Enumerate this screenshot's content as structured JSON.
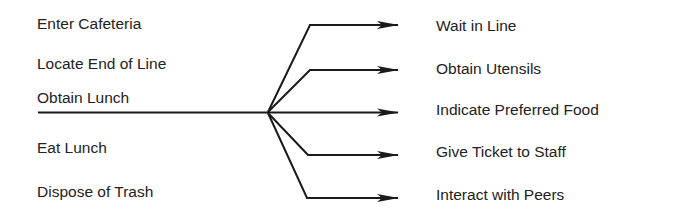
{
  "diagram": {
    "left_steps": [
      {
        "label": "Enter Cafeteria"
      },
      {
        "label": "Locate End of Line"
      },
      {
        "label": "Obtain Lunch",
        "expanded": true
      },
      {
        "label": "Eat Lunch"
      },
      {
        "label": "Dispose of Trash"
      }
    ],
    "right_substeps": [
      {
        "label": "Wait in Line"
      },
      {
        "label": "Obtain Utensils"
      },
      {
        "label": "Indicate Preferred Food"
      },
      {
        "label": "Give Ticket to Staff"
      },
      {
        "label": "Interact with Peers"
      }
    ],
    "line_color": "#1a1a1a"
  }
}
